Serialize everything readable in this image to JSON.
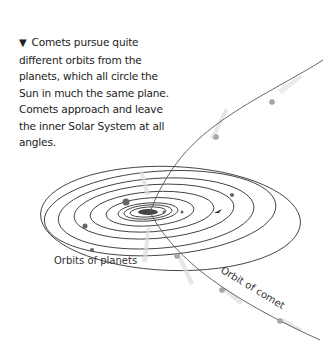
{
  "caption": {
    "marker": "▼",
    "text": "Comets pursue quite different orbits from the planets, which all circle the Sun in much the same plane. Comets approach and leave the inner Solar System at all angles."
  },
  "labels": {
    "planets": "Orbits of planets",
    "comet": "Orbit of comet"
  },
  "colors": {
    "orbit_line": "#333333",
    "comet_line": "#555555",
    "comet_glow": "#cccccc",
    "planet_dot": "#666666"
  }
}
